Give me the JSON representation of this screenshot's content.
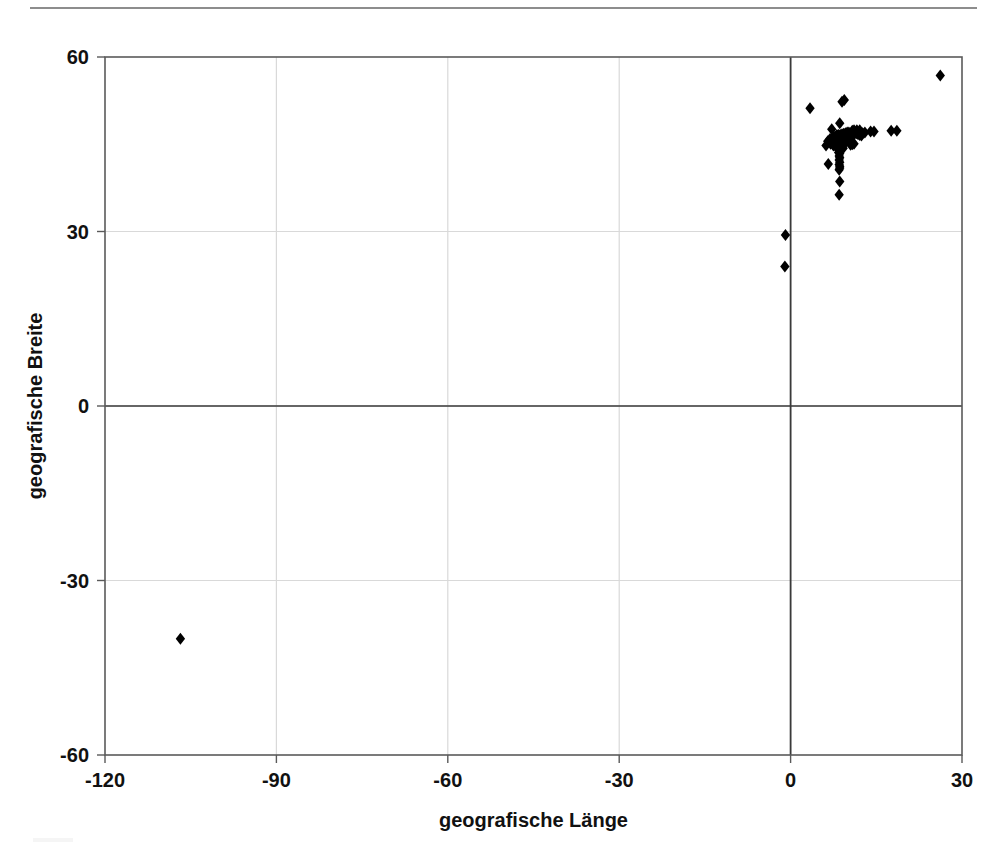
{
  "figure": {
    "name": "geographic-scatter-plot",
    "background": "#ffffff",
    "has_top_rule": true,
    "top_rule_color": "#8d8d8d"
  },
  "axes": {
    "x_title": "geografische Länge",
    "y_title": "geografische Breite",
    "x_ticks": [
      "-120",
      "-90",
      "-60",
      "-30",
      "0",
      "30"
    ],
    "y_ticks": [
      "60",
      "30",
      "0",
      "-30",
      "-60"
    ],
    "frame_color": "#5a5a5a",
    "grid_color": "#d9d9d9",
    "zero_axis_color": "#3a3a3a",
    "marker_color": "#000000"
  },
  "chart_data": {
    "type": "scatter",
    "title": "",
    "subtitle": "",
    "xlabel": "geografische Länge",
    "ylabel": "geografische Breite",
    "xlim": [
      -120,
      30
    ],
    "ylim": [
      -60,
      60
    ],
    "xticks": [
      -120,
      -90,
      -60,
      -30,
      0,
      30
    ],
    "yticks": [
      -60,
      -30,
      0,
      30,
      60
    ],
    "grid": true,
    "legend": null,
    "marker": "diamond",
    "marker_color": "#000000",
    "marker_size": 6,
    "series": [
      {
        "name": "Fundorte",
        "points": [
          [
            26.2,
            56.8
          ],
          [
            3.4,
            51.2
          ],
          [
            9.0,
            52.3
          ],
          [
            9.4,
            52.6
          ],
          [
            8.6,
            48.6
          ],
          [
            7.2,
            47.6
          ],
          [
            11.6,
            47.4
          ],
          [
            12.1,
            47.4
          ],
          [
            14.0,
            47.2
          ],
          [
            14.6,
            47.2
          ],
          [
            17.6,
            47.3
          ],
          [
            18.6,
            47.3
          ],
          [
            8.1,
            46.6
          ],
          [
            8.4,
            46.6
          ],
          [
            8.7,
            46.6
          ],
          [
            9.0,
            46.7
          ],
          [
            9.3,
            46.8
          ],
          [
            9.6,
            46.9
          ],
          [
            9.9,
            47.0
          ],
          [
            10.2,
            47.0
          ],
          [
            7.6,
            46.3
          ],
          [
            7.9,
            46.3
          ],
          [
            8.2,
            46.4
          ],
          [
            8.5,
            46.4
          ],
          [
            8.8,
            46.5
          ],
          [
            9.1,
            46.5
          ],
          [
            9.4,
            46.5
          ],
          [
            9.7,
            46.4
          ],
          [
            10.0,
            46.4
          ],
          [
            10.3,
            46.3
          ],
          [
            6.9,
            45.9
          ],
          [
            7.2,
            45.9
          ],
          [
            7.5,
            46.0
          ],
          [
            7.8,
            46.0
          ],
          [
            8.1,
            46.1
          ],
          [
            8.4,
            46.1
          ],
          [
            8.7,
            46.1
          ],
          [
            9.0,
            46.2
          ],
          [
            9.3,
            46.2
          ],
          [
            9.6,
            46.1
          ],
          [
            9.9,
            46.0
          ],
          [
            10.2,
            46.0
          ],
          [
            10.5,
            45.9
          ],
          [
            6.5,
            45.5
          ],
          [
            6.8,
            45.5
          ],
          [
            7.1,
            45.6
          ],
          [
            7.4,
            45.6
          ],
          [
            7.7,
            45.7
          ],
          [
            8.0,
            45.7
          ],
          [
            8.3,
            45.8
          ],
          [
            8.6,
            45.8
          ],
          [
            8.9,
            45.8
          ],
          [
            9.2,
            45.7
          ],
          [
            9.5,
            45.6
          ],
          [
            9.8,
            45.6
          ],
          [
            10.1,
            45.5
          ],
          [
            7.0,
            45.1
          ],
          [
            7.3,
            45.2
          ],
          [
            7.6,
            45.2
          ],
          [
            7.9,
            45.3
          ],
          [
            8.2,
            45.3
          ],
          [
            8.5,
            45.3
          ],
          [
            8.8,
            45.2
          ],
          [
            9.1,
            45.1
          ],
          [
            9.4,
            45.1
          ],
          [
            6.2,
            44.8
          ],
          [
            7.5,
            44.8
          ],
          [
            7.8,
            44.8
          ],
          [
            8.1,
            44.7
          ],
          [
            8.4,
            44.7
          ],
          [
            8.7,
            44.7
          ],
          [
            9.0,
            44.6
          ],
          [
            8.3,
            44.2
          ],
          [
            8.6,
            44.2
          ],
          [
            8.9,
            44.3
          ],
          [
            9.2,
            44.3
          ],
          [
            8.4,
            43.6
          ],
          [
            8.6,
            43.4
          ],
          [
            8.5,
            43.0
          ],
          [
            8.6,
            42.7
          ],
          [
            8.5,
            42.3
          ],
          [
            8.6,
            41.9
          ],
          [
            6.6,
            41.6
          ],
          [
            8.5,
            41.5
          ],
          [
            8.6,
            41.2
          ],
          [
            8.6,
            40.9
          ],
          [
            8.5,
            40.6
          ],
          [
            8.6,
            38.6
          ],
          [
            8.5,
            36.3
          ],
          [
            11.2,
            46.8
          ],
          [
            11.5,
            46.9
          ],
          [
            11.8,
            46.7
          ],
          [
            12.1,
            46.6
          ],
          [
            12.4,
            46.5
          ],
          [
            10.8,
            47.3
          ],
          [
            11.1,
            47.4
          ],
          [
            10.5,
            44.9
          ],
          [
            10.8,
            45.0
          ],
          [
            11.1,
            45.1
          ],
          [
            12.6,
            46.9
          ],
          [
            13.0,
            47.0
          ],
          [
            -0.9,
            29.4
          ],
          [
            -1.0,
            24.0
          ],
          [
            -106.8,
            -40.0
          ]
        ]
      }
    ]
  }
}
